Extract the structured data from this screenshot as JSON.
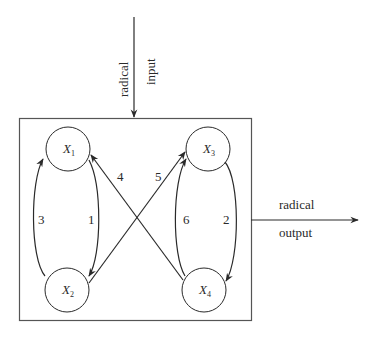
{
  "diagram": {
    "input": {
      "line1": "radical",
      "line2": "input"
    },
    "output": {
      "line1": "radical",
      "line2": "output"
    },
    "nodes": [
      {
        "id": "X1",
        "base": "X",
        "sub": "1"
      },
      {
        "id": "X2",
        "base": "X",
        "sub": "2"
      },
      {
        "id": "X3",
        "base": "X",
        "sub": "3"
      },
      {
        "id": "X4",
        "base": "X",
        "sub": "4"
      }
    ],
    "edges": [
      {
        "label": "1",
        "from": "X1",
        "to": "X2"
      },
      {
        "label": "2",
        "from": "X3",
        "to": "X4"
      },
      {
        "label": "3",
        "from": "X2",
        "to": "X1"
      },
      {
        "label": "4",
        "from": "X4",
        "to": "X1"
      },
      {
        "label": "5",
        "from": "X2",
        "to": "X3"
      },
      {
        "label": "6",
        "from": "X4",
        "to": "X3"
      }
    ],
    "colors": {
      "stroke": "#2a2a2a",
      "box": "#555555"
    }
  }
}
